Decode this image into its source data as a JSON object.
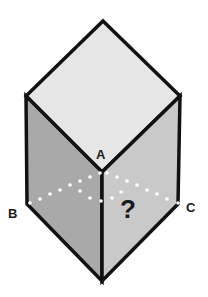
{
  "diagram": {
    "type": "isometric-cube-puzzle",
    "labels": {
      "a": "A",
      "b": "B",
      "c": "C",
      "question": "?"
    },
    "colors": {
      "top_face": "#e6e6e6",
      "left_face": "#a9a9a9",
      "right_face": "#c9c9c9",
      "edge": "#111111",
      "dots": "#ffffff"
    }
  }
}
